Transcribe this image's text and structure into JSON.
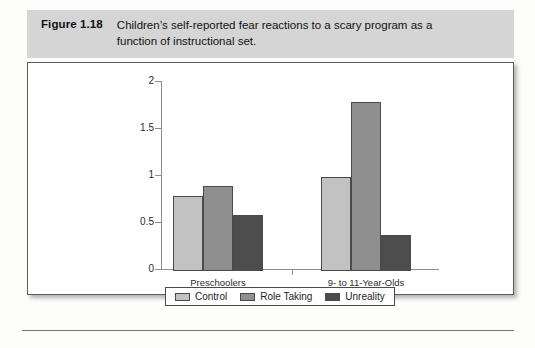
{
  "figure": {
    "label": "Figure 1.18",
    "caption": "Children’s self-reported fear reactions to a scary program as a function of instructional set."
  },
  "chart_data": {
    "type": "bar",
    "title": "",
    "subtitle": "",
    "xlabel": "",
    "ylabel": "",
    "categories": [
      "Preschoolers",
      "9- to 11-Year-Olds"
    ],
    "series": [
      {
        "name": "Control",
        "values": [
          0.8,
          1.0
        ],
        "color": "#c2c2c2"
      },
      {
        "name": "Role Taking",
        "values": [
          0.9,
          1.8
        ],
        "color": "#8f8f8f"
      },
      {
        "name": "Unreality",
        "values": [
          0.6,
          0.38
        ],
        "color": "#4d4d4d"
      }
    ],
    "ylim": [
      0,
      2
    ],
    "yticks": [
      0,
      0.5,
      1,
      1.5,
      2
    ],
    "ytick_labels": [
      "0",
      "0.5",
      "1",
      "1.5",
      "2"
    ],
    "grid": false,
    "legend_position": "bottom"
  },
  "colors": {
    "caption_band": "#d5d5d5",
    "box_border": "#5c5c5c",
    "axis": "#8d8d8d",
    "bar_outline": "#4a4a4a"
  }
}
